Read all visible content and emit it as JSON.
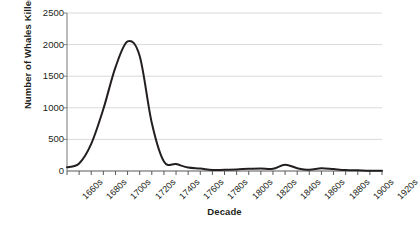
{
  "chart_data": {
    "type": "line",
    "title": "",
    "xlabel": "Decade",
    "ylabel": "Number of Whales Killed",
    "ylim": [
      0,
      2500
    ],
    "yticks": [
      0,
      500,
      1000,
      1500,
      2000,
      2500
    ],
    "ytick_labels": [
      "0",
      "500",
      "1000",
      "1500",
      "2000",
      "2500"
    ],
    "grid": "horizontal",
    "legend": "none",
    "categories": [
      "1660s",
      "1670s",
      "1680s",
      "1690s",
      "1700s",
      "1710s",
      "1720s",
      "1730s",
      "1740s",
      "1750s",
      "1760s",
      "1770s",
      "1780s",
      "1790s",
      "1800s",
      "1810s",
      "1820s",
      "1830s",
      "1840s",
      "1850s",
      "1860s",
      "1870s",
      "1880s",
      "1890s",
      "1900s",
      "1910s",
      "1920s"
    ],
    "xtick_labels": [
      "1660s",
      "",
      "1680s",
      "",
      "1700s",
      "",
      "1720s",
      "",
      "1740s",
      "",
      "1760s",
      "",
      "1780s",
      "",
      "1800s",
      "",
      "1820s",
      "",
      "1840s",
      "",
      "1860s",
      "",
      "1880s",
      "",
      "1900s",
      "",
      "1920s"
    ],
    "series": [
      {
        "name": "Whales killed",
        "values": [
          60,
          120,
          430,
          980,
          1640,
          2050,
          1820,
          760,
          150,
          110,
          55,
          40,
          15,
          20,
          25,
          35,
          40,
          35,
          100,
          45,
          20,
          45,
          30,
          15,
          10,
          5,
          5
        ]
      }
    ],
    "annotations": {
      "peak_decade": "1710s",
      "peak_value": 2050
    },
    "colors": {
      "line": "#231f20",
      "grid": "#d9d9d9",
      "axis": "#808285",
      "text": "#231f20",
      "background": "#ffffff"
    }
  }
}
